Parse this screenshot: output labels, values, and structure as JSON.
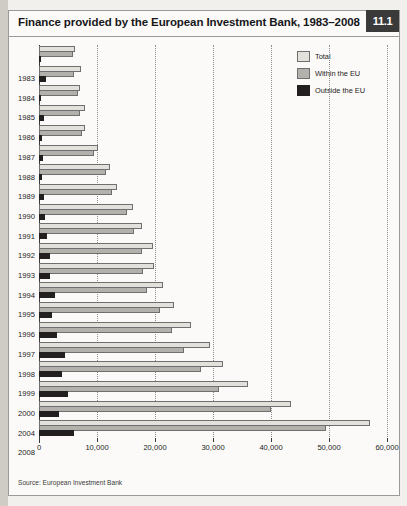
{
  "figure": {
    "title": "Finance provided by the European Investment Bank, 1983–2008",
    "badge": "11.1",
    "source": "Source: European Investment Bank"
  },
  "legend": {
    "position": "top-right",
    "items": [
      {
        "label": "Total",
        "color": "#e3e1dc"
      },
      {
        "label": "Within the EU",
        "color": "#b3b1ab"
      },
      {
        "label": "Outside the EU",
        "color": "#231f20"
      }
    ]
  },
  "axis": {
    "x_ticks": [
      "0",
      "10,000",
      "20,000",
      "30,000",
      "40,000",
      "50,000",
      "60,000"
    ],
    "x_tick_values": [
      0,
      10000,
      20000,
      30000,
      40000,
      50000,
      60000
    ]
  },
  "chart_data": {
    "type": "bar",
    "orientation": "horizontal",
    "title": "Finance provided by the European Investment Bank, 1983–2008",
    "xlabel": "",
    "ylabel": "",
    "xlim": [
      0,
      60000
    ],
    "grid": true,
    "legend_position": "top-right",
    "categories": [
      "1983",
      "1984",
      "1985",
      "1986",
      "1987",
      "1988",
      "1989",
      "1990",
      "1991",
      "1992",
      "1993",
      "1994",
      "1995",
      "1996",
      "1997",
      "1998",
      "1999",
      "2000",
      "2004",
      "2008"
    ],
    "series": [
      {
        "name": "Total",
        "color": "#e3e1dc",
        "values": [
          6200,
          7200,
          7100,
          7900,
          8000,
          10200,
          12200,
          13400,
          16200,
          17700,
          19600,
          19900,
          21400,
          23200,
          26200,
          29500,
          31800,
          36000,
          43500,
          57000
        ]
      },
      {
        "name": "Within the EU",
        "color": "#b3b1ab",
        "values": [
          5800,
          6000,
          6700,
          7100,
          7400,
          9500,
          11600,
          12600,
          15100,
          16400,
          17700,
          18000,
          18600,
          20900,
          23000,
          25000,
          28000,
          31000,
          40000,
          49500
        ]
      },
      {
        "name": "Outside the EU",
        "color": "#231f20",
        "values": [
          400,
          1200,
          400,
          800,
          600,
          700,
          600,
          800,
          1100,
          1300,
          1900,
          1900,
          2800,
          2300,
          3100,
          4500,
          4000,
          5000,
          3500,
          6000
        ]
      }
    ]
  }
}
